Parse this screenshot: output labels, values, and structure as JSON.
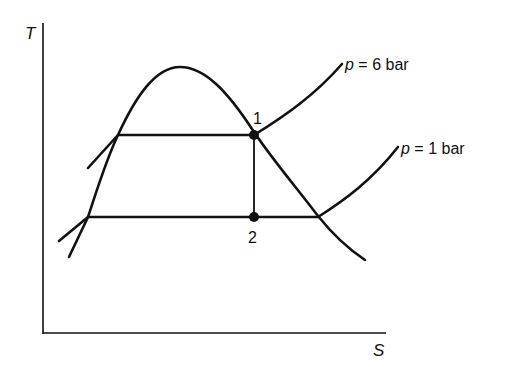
{
  "diagram": {
    "type": "T-s diagram",
    "axes": {
      "y_label": "T",
      "x_label": "S"
    },
    "isobars": [
      {
        "label_var": "p",
        "label_rest": " = 6 bar",
        "pressure": "6 bar"
      },
      {
        "label_var": "p",
        "label_rest": " = 1 bar",
        "pressure": "1 bar"
      }
    ],
    "points": [
      {
        "label": "1"
      },
      {
        "label": "2"
      }
    ],
    "colors": {
      "line": "#111111",
      "background": "#ffffff"
    }
  }
}
